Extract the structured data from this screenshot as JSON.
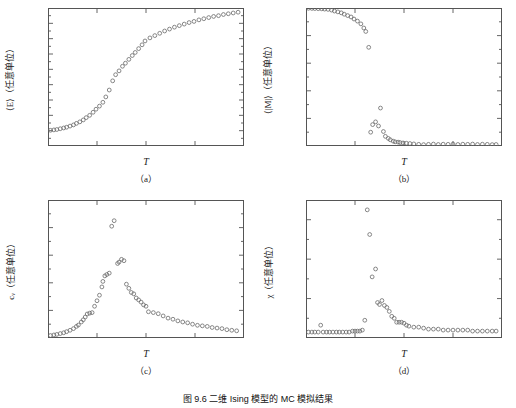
{
  "figure": {
    "caption": "图 9.6  二维 Ising 模型的 MC 模拟结果",
    "marker_color": "#6a6a6a",
    "axis_color": "#555555"
  },
  "panels": [
    {
      "key": "a",
      "label": "（a）",
      "ytitle_pre": "⟨E⟩（任意单位）",
      "xtitle": "T"
    },
    {
      "key": "b",
      "label": "（b）",
      "ytitle_pre": "⟨|M|⟩（任意单位）",
      "xtitle": "T"
    },
    {
      "key": "c",
      "label": "（c）",
      "ytitle_pre": "cᵥ（任意单位）",
      "xtitle": "T"
    },
    {
      "key": "d",
      "label": "（d）",
      "ytitle_pre": "χ（任意单位）",
      "xtitle": "T"
    }
  ],
  "chart_data": [
    {
      "type": "scatter",
      "panel": "a",
      "title": "",
      "xlabel": "T",
      "ylabel": "⟨E⟩ (arbitrary units)",
      "xlim": [
        1,
        5
      ],
      "ylim": [
        -2.2,
        -0.4
      ],
      "xticks": [
        1,
        2,
        3,
        4,
        5
      ],
      "xticklabels": [
        "1",
        "2",
        "3",
        "4",
        "5"
      ],
      "yticks": [
        -2.2,
        -2.0,
        -1.8,
        -1.6,
        -1.4,
        -1.2,
        -1.0,
        -0.8,
        -0.6,
        -0.4
      ],
      "yticklabels": [
        "-2.2",
        "-2.0",
        "-1.8",
        "-1.6",
        "-1.4",
        "-1.2",
        "-1.0",
        "-0.8",
        "-0.6",
        "-0.4"
      ],
      "grid": false,
      "legend": null,
      "marker": "open-circle",
      "x": [
        1.05,
        1.12,
        1.18,
        1.25,
        1.32,
        1.38,
        1.45,
        1.52,
        1.58,
        1.65,
        1.72,
        1.78,
        1.85,
        1.92,
        1.98,
        2.05,
        2.12,
        2.18,
        2.25,
        2.32,
        2.38,
        2.45,
        2.52,
        2.58,
        2.65,
        2.72,
        2.78,
        2.85,
        2.92,
        2.98,
        3.08,
        3.18,
        3.28,
        3.38,
        3.48,
        3.58,
        3.68,
        3.78,
        3.88,
        3.98,
        4.08,
        4.18,
        4.28,
        4.38,
        4.48,
        4.58,
        4.68,
        4.78,
        4.88
      ],
      "y": [
        -1.995,
        -1.99,
        -1.985,
        -1.975,
        -1.965,
        -1.955,
        -1.94,
        -1.925,
        -1.905,
        -1.885,
        -1.86,
        -1.83,
        -1.8,
        -1.76,
        -1.72,
        -1.68,
        -1.63,
        -1.56,
        -1.47,
        -1.35,
        -1.27,
        -1.22,
        -1.16,
        -1.12,
        -1.07,
        -1.02,
        -0.98,
        -0.93,
        -0.88,
        -0.83,
        -0.79,
        -0.76,
        -0.73,
        -0.7,
        -0.675,
        -0.65,
        -0.63,
        -0.61,
        -0.59,
        -0.575,
        -0.555,
        -0.54,
        -0.525,
        -0.51,
        -0.5,
        -0.485,
        -0.475,
        -0.465,
        -0.455
      ]
    },
    {
      "type": "scatter",
      "panel": "b",
      "title": "",
      "xlabel": "T",
      "ylabel": "⟨|M|⟩ (arbitrary units)",
      "xlim": [
        1,
        5
      ],
      "ylim": [
        0.0,
        1.0
      ],
      "xticks": [
        1,
        2,
        3,
        4,
        5
      ],
      "xticklabels": [
        "1",
        "2",
        "3",
        "4",
        "5"
      ],
      "yticks": [
        0.0,
        0.2,
        0.4,
        0.6,
        0.8,
        1.0
      ],
      "yticklabels": [
        "0.0",
        "0.2",
        "0.4",
        "0.6",
        "0.8",
        "1.0"
      ],
      "grid": false,
      "legend": null,
      "marker": "open-circle",
      "x": [
        1.05,
        1.12,
        1.18,
        1.25,
        1.32,
        1.38,
        1.45,
        1.52,
        1.58,
        1.65,
        1.72,
        1.78,
        1.85,
        1.92,
        1.98,
        2.05,
        2.12,
        2.18,
        2.22,
        2.28,
        2.32,
        2.36,
        2.42,
        2.48,
        2.52,
        2.58,
        2.62,
        2.68,
        2.72,
        2.78,
        2.82,
        2.88,
        2.92,
        2.98,
        3.05,
        3.12,
        3.2,
        3.3,
        3.4,
        3.5,
        3.6,
        3.7,
        3.8,
        3.9,
        4.0,
        4.1,
        4.2,
        4.3,
        4.4,
        4.5,
        4.6,
        4.7,
        4.8,
        4.88
      ],
      "y": [
        0.998,
        0.997,
        0.996,
        0.995,
        0.994,
        0.992,
        0.99,
        0.985,
        0.978,
        0.972,
        0.965,
        0.955,
        0.945,
        0.935,
        0.92,
        0.905,
        0.885,
        0.855,
        0.83,
        0.715,
        0.1,
        0.155,
        0.175,
        0.145,
        0.275,
        0.105,
        0.07,
        0.055,
        0.045,
        0.035,
        0.03,
        0.028,
        0.025,
        0.022,
        0.02,
        0.018,
        0.015,
        0.012,
        0.01,
        0.012,
        0.014,
        0.011,
        0.013,
        0.012,
        0.014,
        0.011,
        0.013,
        0.012,
        0.014,
        0.011,
        0.013,
        0.012,
        0.01,
        0.011
      ]
    },
    {
      "type": "scatter",
      "panel": "c",
      "title": "",
      "xlabel": "T",
      "ylabel": "c_V (arbitrary units)",
      "xlim": [
        1,
        5
      ],
      "ylim": [
        0.0,
        0.005
      ],
      "xticks": [
        1,
        2,
        3,
        4,
        5
      ],
      "xticklabels": [
        "1",
        "2",
        "3",
        "4",
        "5"
      ],
      "yticks": [
        0.0,
        0.001,
        0.002,
        0.003,
        0.004,
        0.005
      ],
      "yticklabels": [
        "0.000",
        "0.001",
        "0.002",
        "0.003",
        "0.004",
        "0.005"
      ],
      "grid": false,
      "legend": null,
      "marker": "open-circle",
      "x": [
        1.05,
        1.12,
        1.18,
        1.25,
        1.32,
        1.38,
        1.45,
        1.52,
        1.58,
        1.62,
        1.68,
        1.72,
        1.76,
        1.8,
        1.85,
        1.9,
        1.95,
        2.0,
        2.05,
        2.1,
        2.12,
        2.16,
        2.2,
        2.25,
        2.3,
        2.35,
        2.42,
        2.45,
        2.5,
        2.55,
        2.6,
        2.65,
        2.7,
        2.75,
        2.8,
        2.85,
        2.9,
        2.95,
        3.0,
        3.05,
        3.15,
        3.25,
        3.35,
        3.45,
        3.55,
        3.65,
        3.75,
        3.85,
        3.95,
        4.05,
        4.15,
        4.25,
        4.35,
        4.45,
        4.55,
        4.65,
        4.75,
        4.85
      ],
      "y": [
        9e-05,
        0.00011,
        0.00013,
        0.00016,
        0.00019,
        0.00023,
        0.00028,
        0.00034,
        0.00042,
        0.00047,
        0.00058,
        0.00066,
        0.00076,
        0.00087,
        0.0009,
        0.00092,
        0.00115,
        0.00135,
        0.00155,
        0.00185,
        0.00205,
        0.00225,
        0.0023,
        0.00235,
        0.00405,
        0.00425,
        0.0027,
        0.00275,
        0.00285,
        0.0028,
        0.00195,
        0.0018,
        0.00165,
        0.0016,
        0.00145,
        0.00138,
        0.0013,
        0.0012,
        0.00115,
        0.00095,
        0.00092,
        0.00088,
        0.0008,
        0.00072,
        0.00068,
        0.00062,
        0.00058,
        0.00055,
        0.0005,
        0.00046,
        0.00044,
        0.00042,
        0.00038,
        0.00036,
        0.00034,
        0.0003,
        0.00028,
        0.00026
      ]
    },
    {
      "type": "scatter",
      "panel": "d",
      "title": "",
      "xlabel": "T",
      "ylabel": "χ (arbitrary units)",
      "xlim": [
        1,
        5
      ],
      "ylim": [
        0.0,
        0.14
      ],
      "xticks": [
        1,
        2,
        3,
        4,
        5
      ],
      "xticklabels": [
        "1",
        "2",
        "3",
        "4",
        "5"
      ],
      "yticks": [
        0.0,
        0.04,
        0.08,
        0.12
      ],
      "yticklabels": [
        "0.00",
        "0.04",
        "0.08",
        "0.12"
      ],
      "grid": false,
      "legend": null,
      "marker": "open-circle",
      "x": [
        1.05,
        1.12,
        1.18,
        1.25,
        1.3,
        1.35,
        1.42,
        1.48,
        1.55,
        1.62,
        1.68,
        1.75,
        1.82,
        1.88,
        1.95,
        2.0,
        2.05,
        2.1,
        2.15,
        2.2,
        2.25,
        2.3,
        2.35,
        2.42,
        2.46,
        2.5,
        2.55,
        2.6,
        2.65,
        2.7,
        2.75,
        2.8,
        2.85,
        2.9,
        2.95,
        3.0,
        3.05,
        3.1,
        3.2,
        3.3,
        3.4,
        3.5,
        3.6,
        3.7,
        3.8,
        3.9,
        4.0,
        4.1,
        4.2,
        4.3,
        4.4,
        4.5,
        4.6,
        4.7,
        4.8,
        4.88
      ],
      "y": [
        0.006,
        0.006,
        0.006,
        0.006,
        0.013,
        0.006,
        0.006,
        0.006,
        0.006,
        0.006,
        0.006,
        0.006,
        0.006,
        0.006,
        0.007,
        0.007,
        0.007,
        0.007,
        0.008,
        0.018,
        0.13,
        0.105,
        0.062,
        0.07,
        0.036,
        0.034,
        0.038,
        0.033,
        0.031,
        0.027,
        0.022,
        0.02,
        0.016,
        0.016,
        0.016,
        0.015,
        0.013,
        0.012,
        0.011,
        0.011,
        0.01,
        0.009,
        0.009,
        0.009,
        0.008,
        0.008,
        0.008,
        0.008,
        0.008,
        0.008,
        0.007,
        0.007,
        0.007,
        0.007,
        0.007,
        0.007
      ]
    }
  ]
}
